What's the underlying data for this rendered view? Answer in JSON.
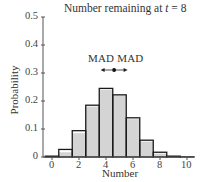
{
  "chart_data": {
    "type": "bar",
    "title": "Number remaining at t = 8",
    "title_parts": {
      "prefix": "Number remaining at ",
      "var": "t",
      "suffix": " = 8"
    },
    "xlabel": "Number",
    "ylabel": "Probability",
    "categories": [
      0,
      1,
      2,
      3,
      4,
      5,
      6,
      7,
      8,
      9,
      10
    ],
    "series": [
      {
        "name": "outline",
        "values": [
          0.003,
          0.027,
          0.094,
          0.185,
          0.245,
          0.222,
          0.14,
          0.06,
          0.017,
          0.003,
          0.0005
        ]
      },
      {
        "name": "filled",
        "values": [
          0.001,
          0.017,
          0.085,
          0.18,
          0.24,
          0.22,
          0.135,
          0.055,
          0.012,
          0.002,
          0.0003
        ]
      }
    ],
    "x_ticks": [
      "0",
      "2",
      "4",
      "6",
      "8",
      "10"
    ],
    "y_ticks": [
      "0",
      "0.1",
      "0.2",
      "0.3",
      "0.4",
      "0.5"
    ],
    "ylim": [
      0,
      0.5
    ],
    "xlim": [
      -0.5,
      10.5
    ],
    "grid": false,
    "annotation": {
      "text": "MAD MAD",
      "mean": 4.6,
      "mad_left": 3.6,
      "mad_right": 5.6
    },
    "colors": {
      "fill": "#d4d4d4",
      "outline": "#1a1a1a",
      "axis": "#555555"
    }
  }
}
